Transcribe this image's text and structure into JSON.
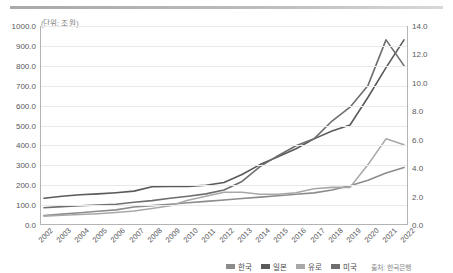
{
  "unit_label": "(단위: 조 원)",
  "source_label": "출처: 한국은행",
  "legend": [
    {
      "label": "한국",
      "color": "#8c8c8c"
    },
    {
      "label": "일본",
      "color": "#5a5a5a"
    },
    {
      "label": "유로",
      "color": "#a8a8a8"
    },
    {
      "label": "미국",
      "color": "#6e6e6e"
    }
  ],
  "chart_data": {
    "type": "line",
    "title": "",
    "subtitle": "",
    "xlabel": "",
    "ylabel": "(단위: 조 원)",
    "y2label": "",
    "grid": true,
    "legend_position": "bottom-right",
    "annotations": [
      "(단위: 조 원)",
      "출처: 한국은행"
    ],
    "x": [
      "2002",
      "2003",
      "2004",
      "2005",
      "2006",
      "2007",
      "2008",
      "2009",
      "2010",
      "2011",
      "2012",
      "2013",
      "2014",
      "2015",
      "2016",
      "2017",
      "2018",
      "2019",
      "2020",
      "2021",
      "2022"
    ],
    "categories": [
      "2002",
      "2003",
      "2004",
      "2005",
      "2006",
      "2007",
      "2008",
      "2009",
      "2010",
      "2011",
      "2012",
      "2013",
      "2014",
      "2015",
      "2016",
      "2017",
      "2018",
      "2019",
      "2020",
      "2021",
      "2022"
    ],
    "ylim": [
      0,
      1000
    ],
    "yticks": [
      "0.0",
      "100.0",
      "200.0",
      "300.0",
      "400.0",
      "500.0",
      "600.0",
      "700.0",
      "800.0",
      "900.0",
      "1000.0"
    ],
    "y2lim": [
      0,
      14
    ],
    "y2ticks": [
      "0.0",
      "2.0",
      "4.0",
      "6.0",
      "8.0",
      "10.0",
      "12.0",
      "14.0"
    ],
    "series": [
      {
        "name": "한국",
        "axis": "right",
        "color": "#8c8c8c",
        "values": [
          0.6,
          0.7,
          0.8,
          0.9,
          1.0,
          1.2,
          1.3,
          1.4,
          1.5,
          1.6,
          1.7,
          1.8,
          1.9,
          2.0,
          2.1,
          2.2,
          2.4,
          2.7,
          3.1,
          3.6,
          4.0
        ]
      },
      {
        "name": "일본",
        "axis": "left",
        "color": "#5a5a5a",
        "values": [
          130,
          140,
          148,
          152,
          158,
          166,
          188,
          190,
          190,
          196,
          210,
          250,
          300,
          340,
          380,
          430,
          470,
          500,
          640,
          790,
          930
        ]
      },
      {
        "name": "유로",
        "axis": "left",
        "color": "#a8a8a8",
        "values": [
          40,
          44,
          48,
          52,
          58,
          66,
          78,
          92,
          120,
          140,
          160,
          160,
          150,
          150,
          158,
          178,
          185,
          185,
          300,
          430,
          400
        ]
      },
      {
        "name": "미국",
        "axis": "left",
        "color": "#6e6e6e",
        "values": [
          82,
          88,
          92,
          96,
          100,
          110,
          118,
          130,
          140,
          152,
          172,
          215,
          290,
          345,
          395,
          430,
          520,
          590,
          700,
          930,
          800
        ]
      }
    ]
  }
}
